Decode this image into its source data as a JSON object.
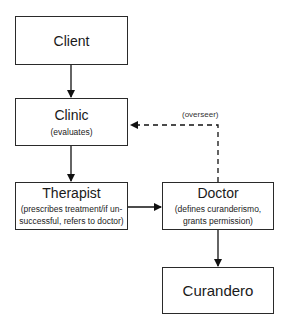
{
  "diagram": {
    "type": "flowchart",
    "nodes": [
      {
        "id": "client",
        "title": "Client",
        "subtitle": ""
      },
      {
        "id": "clinic",
        "title": "Clinic",
        "subtitle": "(evaluates)"
      },
      {
        "id": "therapist",
        "title": "Therapist",
        "subtitle_line1": "(prescribes treatment/if un-",
        "subtitle_line2": "successful, refers to doctor)"
      },
      {
        "id": "doctor",
        "title": "Doctor",
        "subtitle_line1": "(defines curanderismo,",
        "subtitle_line2": "grants permission)"
      },
      {
        "id": "curandero",
        "title": "Curandero",
        "subtitle": ""
      }
    ],
    "edges": [
      {
        "from": "client",
        "to": "clinic",
        "style": "solid",
        "label": ""
      },
      {
        "from": "clinic",
        "to": "therapist",
        "style": "solid",
        "label": ""
      },
      {
        "from": "therapist",
        "to": "doctor",
        "style": "solid",
        "label": ""
      },
      {
        "from": "doctor",
        "to": "curandero",
        "style": "solid",
        "label": ""
      },
      {
        "from": "doctor",
        "to": "clinic",
        "style": "dashed",
        "label": "(overseer)"
      }
    ]
  }
}
